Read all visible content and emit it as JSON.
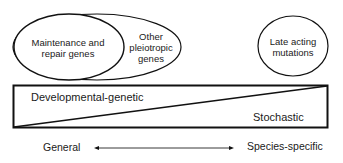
{
  "diagram": {
    "top_left_group": {
      "inner_ellipse": {
        "line1": "Maintenance and",
        "line2": "repair genes"
      },
      "outer_ellipse": {
        "line1": "Other",
        "line2": "pleiotropic",
        "line3": "genes"
      }
    },
    "right_ellipse": {
      "line1": "Late acting",
      "line2": "mutations"
    },
    "wedge_box": {
      "upper_left_label": "Developmental-genetic",
      "lower_right_label": "Stochastic"
    },
    "axis": {
      "left_label": "General",
      "right_label": "Species-specific",
      "arrow": "double-headed"
    },
    "colors": {
      "stroke": "#111111",
      "background": "#ffffff",
      "text": "#1a1a1a"
    }
  }
}
